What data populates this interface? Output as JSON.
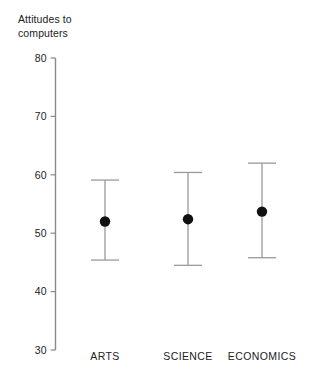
{
  "chart_data": {
    "type": "scatter",
    "title": "Attitudes to\ncomputers",
    "ylabel": "Attitudes to computers",
    "xlabel": "",
    "ylim": [
      30,
      80
    ],
    "yticks": [
      30,
      40,
      50,
      60,
      70,
      80
    ],
    "ytick_labels": [
      "30",
      "40",
      "50",
      "60",
      "70",
      "80"
    ],
    "grid": false,
    "legend": "none",
    "categories": [
      "ARTS",
      "SCIENCE",
      "ECONOMICS"
    ],
    "series": [
      {
        "name": "mean",
        "values": [
          52.0,
          52.4,
          53.7
        ]
      },
      {
        "name": "upper",
        "values": [
          59.1,
          60.4,
          62.0
        ]
      },
      {
        "name": "lower",
        "values": [
          45.4,
          44.5,
          45.8
        ]
      }
    ],
    "points": [
      {
        "category": "ARTS",
        "mean": 52.0,
        "upper": 59.1,
        "lower": 45.4
      },
      {
        "category": "SCIENCE",
        "mean": 52.4,
        "upper": 60.4,
        "lower": 44.5
      },
      {
        "category": "ECONOMICS",
        "mean": 53.7,
        "upper": 62.0,
        "lower": 45.8
      }
    ],
    "colors": {
      "marker": "#111111",
      "whisker": "#9a9a9a",
      "axis": "#8a8a8a",
      "text": "#222222",
      "background": "#ffffff"
    }
  }
}
